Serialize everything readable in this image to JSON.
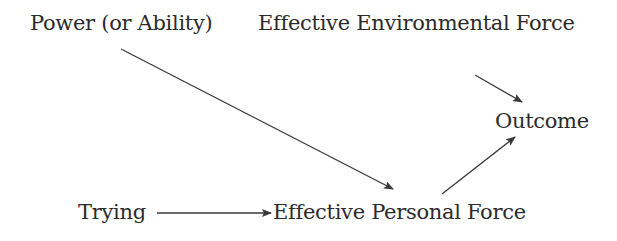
{
  "diagram": {
    "type": "causal-flow",
    "nodes": {
      "power": {
        "label": "Power (or Ability)",
        "x": 30,
        "y": 13
      },
      "environmental": {
        "label": "Effective Environmental Force",
        "x": 258,
        "y": 13
      },
      "outcome": {
        "label": "Outcome",
        "x": 495,
        "y": 111
      },
      "trying": {
        "label": "Trying",
        "x": 78,
        "y": 202
      },
      "personal": {
        "label": "Effective Personal Force",
        "x": 273,
        "y": 202
      }
    },
    "edges": [
      {
        "from": "Power (or Ability)",
        "to": "Effective Personal Force",
        "x1": 121,
        "y1": 49,
        "x2": 393,
        "y2": 189
      },
      {
        "from": "Effective Environmental Force",
        "to": "Outcome",
        "x1": 475,
        "y1": 75,
        "x2": 522,
        "y2": 102
      },
      {
        "from": "Effective Personal Force",
        "to": "Outcome",
        "x1": 442,
        "y1": 194,
        "x2": 515,
        "y2": 137
      },
      {
        "from": "Trying",
        "to": "Effective Personal Force",
        "x1": 157,
        "y1": 213,
        "x2": 271,
        "y2": 213
      }
    ],
    "colors": {
      "text": "#2b2b2b",
      "line": "#3a3a3a",
      "background": "#ffffff"
    }
  }
}
